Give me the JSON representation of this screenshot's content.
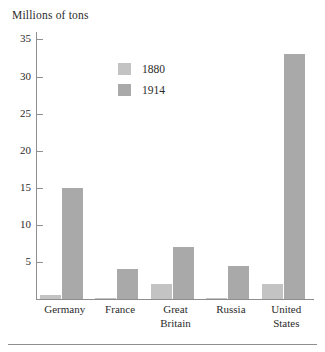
{
  "chart_data": {
    "type": "bar",
    "title": "Millions of tons",
    "xlabel": "",
    "ylabel": "Millions of tons",
    "ylim": [
      0,
      36
    ],
    "yticks": [
      5,
      10,
      15,
      20,
      25,
      30,
      35
    ],
    "grid": false,
    "legend_position": "inside-top-left",
    "categories": [
      "Germany",
      "France",
      "Great Britain",
      "Russia",
      "United States"
    ],
    "series": [
      {
        "name": "1880",
        "color": "#c3c3c3",
        "values": [
          0.5,
          0.1,
          2.0,
          0.1,
          2.0
        ]
      },
      {
        "name": "1914",
        "color": "#a9a9a9",
        "values": [
          15.0,
          4.0,
          7.0,
          4.5,
          33.0
        ]
      }
    ]
  },
  "axis": {
    "title": "Millions of tons",
    "tick_labels": [
      "35",
      "30",
      "25",
      "20",
      "15",
      "10",
      "5"
    ]
  },
  "legend": {
    "entries": [
      {
        "label": "1880"
      },
      {
        "label": "1914"
      }
    ]
  },
  "categories": [
    {
      "line1": "Germany",
      "line2": ""
    },
    {
      "line1": "France",
      "line2": ""
    },
    {
      "line1": "Great",
      "line2": "Britain"
    },
    {
      "line1": "Russia",
      "line2": ""
    },
    {
      "line1": "United",
      "line2": "States"
    }
  ]
}
